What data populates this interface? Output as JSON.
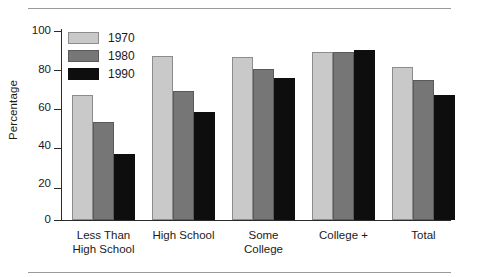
{
  "chart_data": {
    "type": "bar",
    "title": "",
    "xlabel": "",
    "ylabel": "Percentage",
    "ylim": [
      0,
      100
    ],
    "yticks": [
      0,
      20,
      40,
      60,
      80,
      100
    ],
    "grid": false,
    "legend_position": "top-left",
    "categories": [
      "Less Than High School",
      "High School",
      "Some College",
      "College +",
      "Total"
    ],
    "series": [
      {
        "name": "1970",
        "color": "#c9c9c9",
        "values": [
          66,
          87,
          86,
          89,
          81
        ]
      },
      {
        "name": "1980",
        "color": "#767676",
        "values": [
          52,
          68,
          80,
          89,
          74
        ]
      },
      {
        "name": "1990",
        "color": "#0e0e0e",
        "values": [
          35,
          57,
          75,
          90,
          66
        ]
      }
    ]
  },
  "axis": {
    "y_title": "Percentage",
    "y_tick_labels": [
      "100",
      "80",
      "60",
      "40",
      "20",
      "0"
    ]
  },
  "legend": {
    "entries": [
      {
        "label": "1970",
        "swatch": "light-gray-swatch"
      },
      {
        "label": "1980",
        "swatch": "medium-gray-swatch"
      },
      {
        "label": "1990",
        "swatch": "black-swatch"
      }
    ]
  },
  "x_labels": [
    {
      "line1": "Less Than",
      "line2": "High School"
    },
    {
      "line1": "High School",
      "line2": ""
    },
    {
      "line1": "Some",
      "line2": "College"
    },
    {
      "line1": "College +",
      "line2": ""
    },
    {
      "line1": "Total",
      "line2": ""
    }
  ]
}
